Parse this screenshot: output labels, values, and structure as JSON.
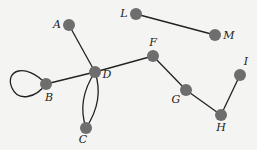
{
  "diagram": {
    "type": "graph",
    "node_color": "#6e6e6e",
    "edge_color": "#222222",
    "nodes": [
      {
        "id": "A",
        "label": "A",
        "x": 69,
        "y": 25,
        "lx": 57,
        "ly": 28
      },
      {
        "id": "L",
        "label": "L",
        "x": 136,
        "y": 14,
        "lx": 124,
        "ly": 17
      },
      {
        "id": "M",
        "label": "M",
        "x": 215,
        "y": 35,
        "lx": 229,
        "ly": 39
      },
      {
        "id": "F",
        "label": "F",
        "x": 153,
        "y": 56,
        "lx": 153,
        "ly": 46
      },
      {
        "id": "D",
        "label": "D",
        "x": 95,
        "y": 72,
        "lx": 107,
        "ly": 78
      },
      {
        "id": "B",
        "label": "B",
        "x": 46,
        "y": 84,
        "lx": 49,
        "ly": 101
      },
      {
        "id": "C",
        "label": "C",
        "x": 86,
        "y": 128,
        "lx": 83,
        "ly": 143
      },
      {
        "id": "G",
        "label": "G",
        "x": 186,
        "y": 90,
        "lx": 176,
        "ly": 103
      },
      {
        "id": "H",
        "label": "H",
        "x": 221,
        "y": 115,
        "lx": 221,
        "ly": 131
      },
      {
        "id": "I",
        "label": "I",
        "x": 240,
        "y": 75,
        "lx": 246,
        "ly": 65
      }
    ],
    "edges": [
      {
        "from": "A",
        "to": "D"
      },
      {
        "from": "B",
        "to": "D"
      },
      {
        "from": "D",
        "to": "F"
      },
      {
        "from": "D",
        "to": "C",
        "curve": "left"
      },
      {
        "from": "D",
        "to": "C",
        "curve": "right"
      },
      {
        "from": "B",
        "to": "B",
        "loop": true
      },
      {
        "from": "F",
        "to": "G"
      },
      {
        "from": "G",
        "to": "H"
      },
      {
        "from": "H",
        "to": "I"
      },
      {
        "from": "L",
        "to": "M"
      }
    ]
  }
}
